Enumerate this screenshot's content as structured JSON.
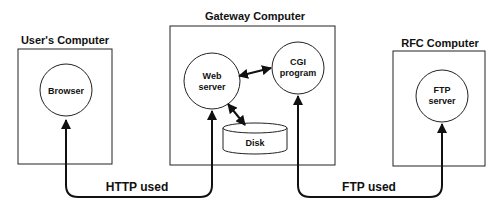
{
  "diagram": {
    "nodes": {
      "users_computer": {
        "title": "User's Computer",
        "component": "Browser"
      },
      "gateway_computer": {
        "title": "Gateway Computer",
        "web_server": [
          "Web",
          "server"
        ],
        "cgi_program": [
          "CGI",
          "program"
        ],
        "disk": "Disk"
      },
      "rfc_computer": {
        "title": "RFC Computer",
        "component": [
          "FTP",
          "server"
        ]
      }
    },
    "edges": {
      "http": "HTTP used",
      "ftp": "FTP used"
    },
    "colors": {
      "line": "#111111",
      "background": "#ffffff"
    }
  }
}
